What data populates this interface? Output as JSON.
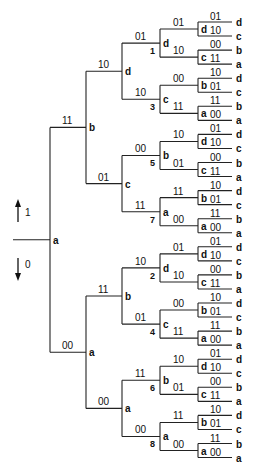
{
  "legend": {
    "up_label": "1",
    "down_label": "0"
  },
  "root": {
    "label": "a",
    "children": [
      {
        "edge": "11",
        "label": "b",
        "num": "",
        "children": [
          {
            "edge": "10",
            "label": "d",
            "num": "",
            "children": [
              {
                "edge": "01",
                "label": "d",
                "num": "1",
                "children": [
                  {
                    "edge": "01",
                    "label": "d",
                    "leaves": [
                      {
                        "edge": "01",
                        "label": "d"
                      },
                      {
                        "edge": "10",
                        "label": "c"
                      }
                    ]
                  },
                  {
                    "edge": "10",
                    "label": "c",
                    "leaves": [
                      {
                        "edge": "00",
                        "label": "b"
                      },
                      {
                        "edge": "11",
                        "label": "a"
                      }
                    ]
                  }
                ]
              },
              {
                "edge": "10",
                "label": "c",
                "num": "3",
                "children": [
                  {
                    "edge": "00",
                    "label": "b",
                    "leaves": [
                      {
                        "edge": "10",
                        "label": "d"
                      },
                      {
                        "edge": "01",
                        "label": "c"
                      }
                    ]
                  },
                  {
                    "edge": "11",
                    "label": "a",
                    "leaves": [
                      {
                        "edge": "11",
                        "label": "b"
                      },
                      {
                        "edge": "00",
                        "label": "a"
                      }
                    ]
                  }
                ]
              }
            ]
          },
          {
            "edge": "01",
            "label": "c",
            "num": "",
            "children": [
              {
                "edge": "00",
                "label": "b",
                "num": "5",
                "children": [
                  {
                    "edge": "10",
                    "label": "d",
                    "leaves": [
                      {
                        "edge": "01",
                        "label": "d"
                      },
                      {
                        "edge": "10",
                        "label": "c"
                      }
                    ]
                  },
                  {
                    "edge": "01",
                    "label": "c",
                    "leaves": [
                      {
                        "edge": "00",
                        "label": "b"
                      },
                      {
                        "edge": "11",
                        "label": "a"
                      }
                    ]
                  }
                ]
              },
              {
                "edge": "11",
                "label": "a",
                "num": "7",
                "children": [
                  {
                    "edge": "11",
                    "label": "b",
                    "leaves": [
                      {
                        "edge": "10",
                        "label": "d"
                      },
                      {
                        "edge": "01",
                        "label": "c"
                      }
                    ]
                  },
                  {
                    "edge": "00",
                    "label": "a",
                    "leaves": [
                      {
                        "edge": "11",
                        "label": "b"
                      },
                      {
                        "edge": "00",
                        "label": "a"
                      }
                    ]
                  }
                ]
              }
            ]
          }
        ]
      },
      {
        "edge": "00",
        "label": "a",
        "num": "",
        "children": [
          {
            "edge": "11",
            "label": "b",
            "num": "",
            "children": [
              {
                "edge": "10",
                "label": "d",
                "num": "2",
                "children": [
                  {
                    "edge": "01",
                    "label": "d",
                    "leaves": [
                      {
                        "edge": "01",
                        "label": "d"
                      },
                      {
                        "edge": "10",
                        "label": "c"
                      }
                    ]
                  },
                  {
                    "edge": "10",
                    "label": "c",
                    "leaves": [
                      {
                        "edge": "00",
                        "label": "b"
                      },
                      {
                        "edge": "11",
                        "label": "a"
                      }
                    ]
                  }
                ]
              },
              {
                "edge": "01",
                "label": "c",
                "num": "4",
                "children": [
                  {
                    "edge": "00",
                    "label": "b",
                    "leaves": [
                      {
                        "edge": "10",
                        "label": "d"
                      },
                      {
                        "edge": "01",
                        "label": "c"
                      }
                    ]
                  },
                  {
                    "edge": "11",
                    "label": "a",
                    "leaves": [
                      {
                        "edge": "11",
                        "label": "b"
                      },
                      {
                        "edge": "00",
                        "label": "a"
                      }
                    ]
                  }
                ]
              }
            ]
          },
          {
            "edge": "00",
            "label": "a",
            "num": "",
            "children": [
              {
                "edge": "11",
                "label": "b",
                "num": "6",
                "children": [
                  {
                    "edge": "10",
                    "label": "d",
                    "leaves": [
                      {
                        "edge": "01",
                        "label": "d"
                      },
                      {
                        "edge": "10",
                        "label": "c"
                      }
                    ]
                  },
                  {
                    "edge": "01",
                    "label": "c",
                    "leaves": [
                      {
                        "edge": "00",
                        "label": "b"
                      },
                      {
                        "edge": "11",
                        "label": "a"
                      }
                    ]
                  }
                ]
              },
              {
                "edge": "00",
                "label": "a",
                "num": "8",
                "children": [
                  {
                    "edge": "11",
                    "label": "b",
                    "leaves": [
                      {
                        "edge": "10",
                        "label": "d"
                      },
                      {
                        "edge": "01",
                        "label": "c"
                      }
                    ]
                  },
                  {
                    "edge": "00",
                    "label": "a",
                    "leaves": [
                      {
                        "edge": "11",
                        "label": "b"
                      },
                      {
                        "edge": "00",
                        "label": "a"
                      }
                    ]
                  }
                ]
              }
            ]
          }
        ]
      }
    ]
  }
}
